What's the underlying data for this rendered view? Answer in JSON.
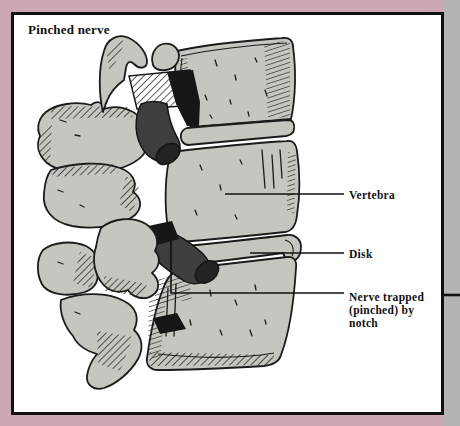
{
  "figure": {
    "title": "Pinched nerve",
    "labels": {
      "vertebra": "Vertebra",
      "disk": "Disk",
      "nerve_line1": "Nerve trapped",
      "nerve_line2": "(pinched) by",
      "nerve_line3": "notch"
    }
  },
  "colors": {
    "margin_pink": "#cda7b1",
    "margin_right_gray": "#b6b3b2",
    "box_background": "#ffffff",
    "box_border": "#111111",
    "bone_fill": "#c6c5bf",
    "nerve_fill": "#3e3e3c",
    "nerve_cap_fill": "#232321",
    "shadow_black": "#161616",
    "outline": "#1b1b1b"
  }
}
